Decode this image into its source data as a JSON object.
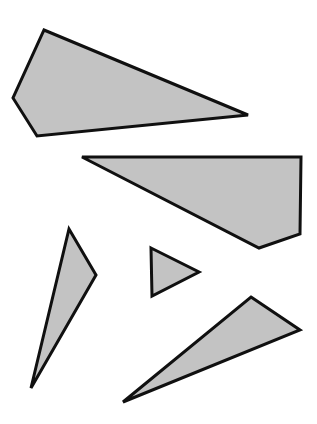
{
  "scene": {
    "title": "Polygon shapes figure",
    "width": 317,
    "height": 424,
    "background_color": "#ffffff",
    "fill_color": "#c3c3c3",
    "stroke_color": "#101010",
    "stroke_width": 3,
    "shape_count": 5
  },
  "shapes": [
    {
      "id": "shape-1",
      "name": "top-left-quadrilateral",
      "sides": 4,
      "points": "44,30 248,115 37,136 13,98",
      "fill": "#c3c3c3",
      "stroke": "#101010",
      "stroke_width": 3
    },
    {
      "id": "shape-2",
      "name": "upper-right-pentagon",
      "sides": 5,
      "points": "82,157 301,157 300,234 259,248 82,157",
      "fill": "#c3c3c3",
      "stroke": "#101010",
      "stroke_width": 3
    },
    {
      "id": "shape-3",
      "name": "left-slim-triangle",
      "sides": 3,
      "points": "69,229 96,275 31,388",
      "fill": "#c3c3c3",
      "stroke": "#101010",
      "stroke_width": 3
    },
    {
      "id": "shape-4",
      "name": "center-small-triangle",
      "sides": 3,
      "points": "151,248 199,272 152,296",
      "fill": "#c3c3c3",
      "stroke": "#101010",
      "stroke_width": 3
    },
    {
      "id": "shape-5",
      "name": "bottom-right-slim-triangle",
      "sides": 3,
      "points": "251,297 300,330 123,402",
      "fill": "#c3c3c3",
      "stroke": "#101010",
      "stroke_width": 3
    }
  ]
}
